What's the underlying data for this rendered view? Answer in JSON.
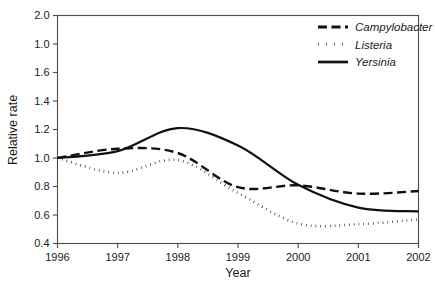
{
  "chart_data": {
    "type": "line",
    "title": "",
    "xlabel": "Year",
    "ylabel": "Relative rate",
    "x": [
      1996,
      1997,
      1998,
      1999,
      2000,
      2001,
      2002
    ],
    "xtick_labels": [
      "1996",
      "1997",
      "1998",
      "1999",
      "2000",
      "2001",
      "2002"
    ],
    "xlim": [
      1996,
      2002
    ],
    "ylim": [
      0.4,
      2.0
    ],
    "ytick_values": [
      0.4,
      0.6,
      0.8,
      1.0,
      1.2,
      1.4,
      1.6,
      1.8,
      2.0
    ],
    "ytick_labels": [
      "0.4",
      "0.6",
      "0.8",
      "1.0",
      "1.2",
      "1.4",
      "1.6",
      "1.0",
      "2.0"
    ],
    "grid": false,
    "legend_position": "top-right",
    "series": [
      {
        "name": "Campylobacter",
        "style": "dashed",
        "values": [
          1.0,
          1.065,
          1.035,
          0.795,
          0.808,
          0.75,
          0.768
        ]
      },
      {
        "name": "Listeria",
        "style": "dotted",
        "values": [
          1.0,
          0.895,
          0.985,
          0.755,
          0.54,
          0.535,
          0.57
        ]
      },
      {
        "name": "Yersinia",
        "style": "solid",
        "values": [
          1.0,
          1.048,
          1.21,
          1.088,
          0.812,
          0.652,
          0.625
        ]
      }
    ]
  },
  "legend": {
    "entries": [
      {
        "label": "Campylobacter"
      },
      {
        "label": "Listeria"
      },
      {
        "label": "Yersinia"
      }
    ]
  },
  "colors": {
    "ink": "#111111",
    "axis": "#4a4a4a",
    "background": "#ffffff"
  }
}
